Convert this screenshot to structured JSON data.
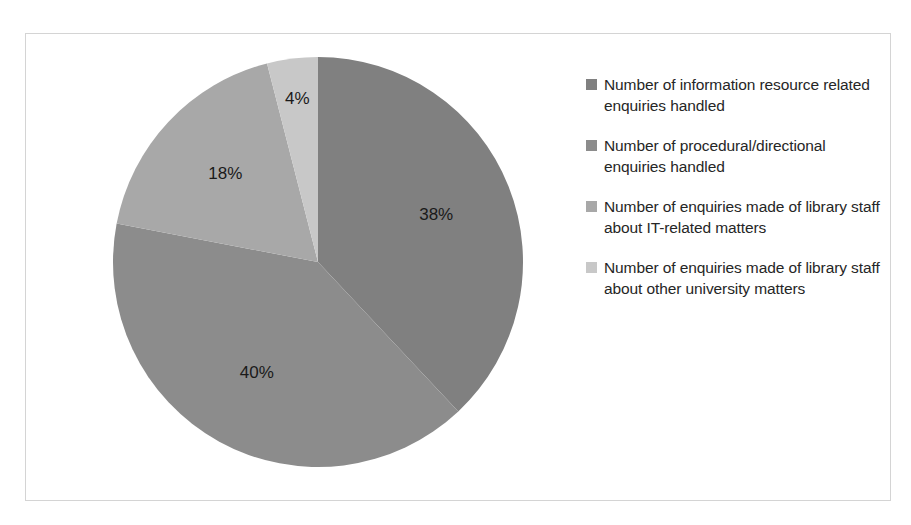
{
  "chart_data": {
    "type": "pie",
    "title": "",
    "legend_position": "right",
    "start_angle_deg": 0,
    "direction": "clockwise",
    "categories": [
      "Number of information resource related enquiries handled",
      "Number of procedural/directional enquiries handled",
      "Number of enquiries made of library staff about IT-related matters",
      "Number of enquiries made of library staff about other university matters"
    ],
    "values": [
      38,
      40,
      18,
      4
    ],
    "data_labels": [
      "38%",
      "40%",
      "18%",
      "4%"
    ],
    "colors": [
      "#808080",
      "#8c8c8c",
      "#a8a8a8",
      "#c8c8c8"
    ],
    "units": "percent"
  },
  "legend": {
    "items": [
      {
        "label": "Number of information resource related enquiries handled",
        "color": "#808080",
        "value": 38,
        "data_label": "38%"
      },
      {
        "label": "Number of procedural/directional enquiries handled",
        "color": "#8c8c8c",
        "value": 40,
        "data_label": "40%"
      },
      {
        "label": "Number of enquiries made of library staff about IT-related matters",
        "color": "#a8a8a8",
        "value": 18,
        "data_label": "18%"
      },
      {
        "label": "Number of enquiries made of library staff about other university matters",
        "color": "#c8c8c8",
        "value": 4,
        "data_label": "4%"
      }
    ]
  },
  "frame": {
    "border_color": "#d4d4d4",
    "background": "#ffffff"
  }
}
